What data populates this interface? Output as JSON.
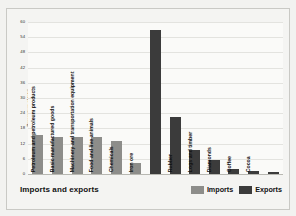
{
  "chart_data": {
    "type": "bar",
    "title": "Imports and exports",
    "xlabel": "",
    "ylabel": "Percentage of total",
    "ylim": [
      0,
      60
    ],
    "ytick_labels": [
      "60",
      "54",
      "48",
      "42",
      "36",
      "30",
      "24",
      "18",
      "12",
      "6",
      "0"
    ],
    "yticks": [
      60,
      54,
      48,
      42,
      36,
      30,
      24,
      18,
      12,
      6,
      0
    ],
    "grid": true,
    "legend_position": "bottom-right",
    "categories": [
      "Petroleum and petroleum products",
      "Basic manufactured goods",
      "Machinery and transportation equipment",
      "Food and live animals",
      "Chemicals",
      "Iron ore",
      "Rubber",
      "Logs and timber",
      "Diamonds",
      "Coffee",
      "Cocoa"
    ],
    "series": [
      {
        "name": "Imports",
        "color": "#8d8d8a",
        "values": [
          15.5,
          14.8,
          14.8,
          14.5,
          13.2,
          4.5,
          null,
          null,
          null,
          null,
          null
        ]
      },
      {
        "name": "Exports",
        "color": "#3b3b3b",
        "values": [
          null,
          null,
          null,
          null,
          null,
          57.0,
          22.5,
          9.5,
          5.5,
          1.8,
          1.2
        ]
      }
    ],
    "bars": [
      {
        "label": "Petroleum and petroleum products",
        "value": 15.5,
        "series": "Imports"
      },
      {
        "label": "Basic manufactured goods",
        "value": 14.8,
        "series": "Imports"
      },
      {
        "label": "Machinery and transportation equipment",
        "value": 14.8,
        "series": "Imports"
      },
      {
        "label": "Food and live animals",
        "value": 14.5,
        "series": "Imports"
      },
      {
        "label": "Chemicals",
        "value": 13.2,
        "series": "Imports"
      },
      {
        "label": "Iron ore",
        "value": 4.5,
        "series": "Imports"
      },
      {
        "label": "",
        "value": 57.0,
        "series": "Exports"
      },
      {
        "label": "Rubber",
        "value": 22.5,
        "series": "Exports"
      },
      {
        "label": "Logs and timber",
        "value": 9.5,
        "series": "Exports"
      },
      {
        "label": "Diamonds",
        "value": 5.5,
        "series": "Exports"
      },
      {
        "label": "Coffee",
        "value": 1.8,
        "series": "Exports"
      },
      {
        "label": "Cocoa",
        "value": 1.2,
        "series": "Exports"
      },
      {
        "label": "",
        "value": 0.6,
        "series": "Exports"
      }
    ]
  },
  "legend": {
    "imports_label": "Imports",
    "exports_label": "Exports"
  },
  "colors": {
    "imports": "#8d8d8a",
    "exports": "#3b3b3b",
    "background": "#f4f4f2",
    "plot_background": "#fafaf8",
    "gridline": "#e3e3df"
  }
}
